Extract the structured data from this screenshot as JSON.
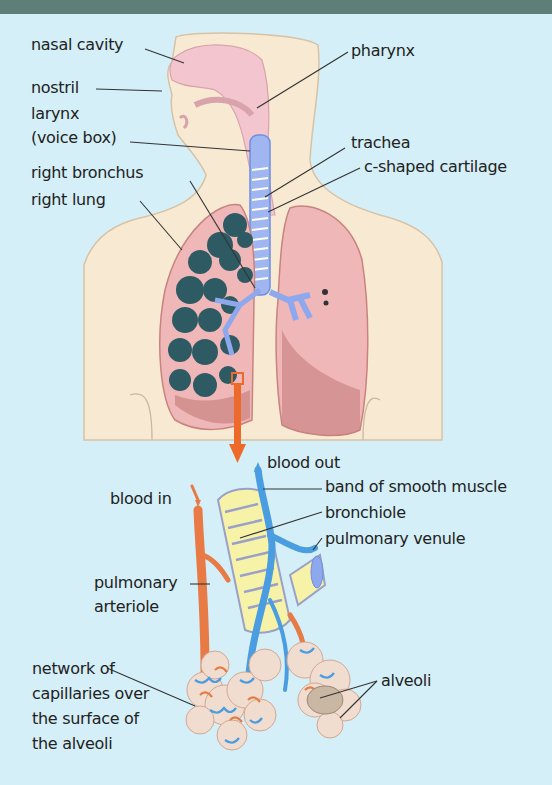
{
  "header": {
    "color": "#5e7f78"
  },
  "colors": {
    "background": "#d4eff8",
    "skin": "#f8ead2",
    "lung": "#f0b7b9",
    "lung_dark": "#c8837f",
    "airway": "#8ea8ee",
    "alveoli_cluster": "#2e5b63",
    "arteriole": "#e87a45",
    "venule": "#4a9de0",
    "bronchiole": "#f6f2a8",
    "pointer": "#ee6a2a"
  },
  "labels": {
    "nasal_cavity": "nasal cavity",
    "nostril": "nostril",
    "larynx_line1": "larynx",
    "larynx_line2": "(voice box)",
    "right_bronchus": "right bronchus",
    "right_lung": "right lung",
    "pharynx": "pharynx",
    "trachea": "trachea",
    "c_shaped_cartilage": "c-shaped cartilage",
    "blood_out": "blood out",
    "blood_in": "blood in",
    "band_of_smooth_muscle": "band of smooth muscle",
    "bronchiole": "bronchiole",
    "pulmonary_venule": "pulmonary venule",
    "pulmonary_arteriole": "pulmonary\narteriole",
    "capillary_network": "network of\ncapillaries over\nthe surface of\nthe alveoli",
    "alveoli": "alveoli"
  }
}
